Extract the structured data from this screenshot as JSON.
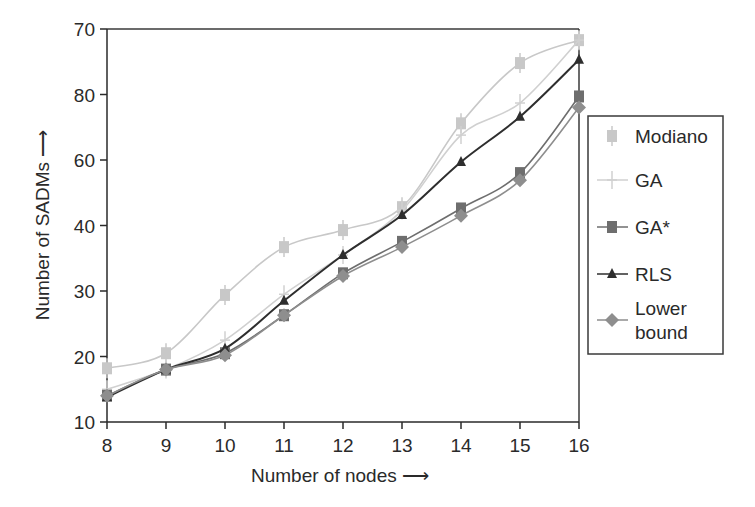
{
  "chart_data": {
    "type": "line",
    "title": "",
    "xlabel": "Number of nodes",
    "ylabel": "Number of SADMs",
    "x": [
      8,
      9,
      10,
      11,
      12,
      13,
      14,
      15,
      16
    ],
    "x_tick_labels": [
      "8",
      "9",
      "10",
      "11",
      "12",
      "13",
      "14",
      "15",
      "16"
    ],
    "y_tick_labels": [
      "10",
      "20",
      "30",
      "40",
      "60",
      "80",
      "70"
    ],
    "ylim": [
      10,
      70
    ],
    "grid": false,
    "legend_position": "right",
    "series": [
      {
        "name": "Modiano",
        "marker": "bar-square",
        "color": "#c8c8c8",
        "values": [
          18.2,
          20.5,
          29.4,
          36.7,
          39.3,
          42.8,
          55.6,
          64.8,
          68.3
        ]
      },
      {
        "name": "GA",
        "marker": "plus",
        "color": "#d0d0d0",
        "values": [
          15,
          18,
          22.5,
          29.5,
          35.5,
          42.3,
          53.8,
          58.7,
          68.3
        ]
      },
      {
        "name": "GA*",
        "marker": "square",
        "color": "#6e6e6e",
        "values": [
          14,
          18,
          20.5,
          26.3,
          32.7,
          37.5,
          42.6,
          48,
          59.7
        ]
      },
      {
        "name": "RLS",
        "marker": "triangle",
        "color": "#2e2e2e",
        "values": [
          13.8,
          18,
          21.2,
          28.5,
          35.5,
          41.6,
          49.7,
          56.6,
          65.3
        ]
      },
      {
        "name": "Lower bound",
        "marker": "diamond",
        "color": "#8e8e8e",
        "values": [
          14,
          18,
          20.2,
          26.3,
          32.3,
          36.7,
          41.5,
          46.9,
          58
        ]
      }
    ]
  },
  "labels": {
    "x_axis_title": "Number of nodes ⟶",
    "y_axis_title": "Number of SADMs ⟶",
    "legend": [
      "Modiano",
      "GA",
      "GA*",
      "RLS",
      "Lower",
      "bound"
    ]
  }
}
